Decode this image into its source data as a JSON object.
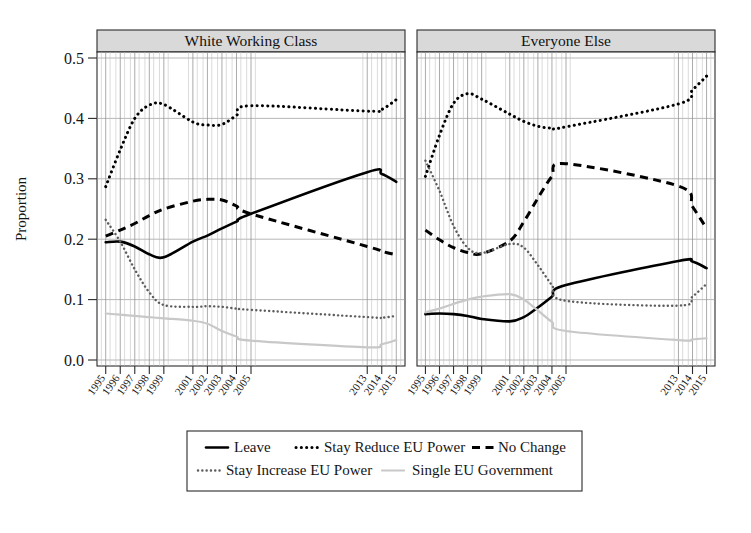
{
  "figure": {
    "ylabel": "Proportion",
    "panels": [
      {
        "title": "White Working Class"
      },
      {
        "title": "Everyone Else"
      }
    ]
  },
  "legend": {
    "items": [
      {
        "label": "Leave",
        "style": "solid",
        "color": "#000000"
      },
      {
        "label": "Stay Reduce EU Power",
        "style": "dotted-bold",
        "color": "#000000"
      },
      {
        "label": "No Change",
        "style": "dashed",
        "color": "#000000"
      },
      {
        "label": "Stay Increase EU Power",
        "style": "dotted-grey",
        "color": "#5d5d5d"
      },
      {
        "label": "Single EU Government",
        "style": "solid-light",
        "color": "#c8c8c8"
      }
    ]
  },
  "chart_data": {
    "type": "line",
    "title": "",
    "xlabel": "",
    "ylabel": "Proportion",
    "ylim": [
      0.0,
      0.5
    ],
    "yticks": [
      "0.0",
      "0.1",
      "0.2",
      "0.3",
      "0.4",
      "0.5"
    ],
    "ytickvalues": [
      0.0,
      0.1,
      0.2,
      0.3,
      0.4,
      0.5
    ],
    "grid": true,
    "legend_position": "bottom",
    "x": [
      1995,
      1996,
      1997,
      1998,
      1999,
      2001,
      2002,
      2003,
      2004,
      2005,
      2013,
      2014,
      2015
    ],
    "xticklabels": [
      "1995",
      "1996",
      "1997",
      "1998",
      "1999",
      "2001",
      "2002",
      "2003",
      "2004",
      "2005",
      "2013",
      "2014",
      "2015"
    ],
    "panels": [
      {
        "name": "White Working Class",
        "series": [
          {
            "name": "Leave",
            "style": "solid",
            "color": "#000000",
            "values": [
              0.195,
              0.196,
              0.188,
              0.175,
              0.17,
              0.196,
              0.206,
              0.218,
              0.229,
              0.242,
              0.311,
              0.308,
              0.295
            ]
          },
          {
            "name": "Stay Reduce EU Power",
            "style": "dotted-bold",
            "color": "#000000",
            "values": [
              0.287,
              0.348,
              0.4,
              0.422,
              0.423,
              0.394,
              0.389,
              0.39,
              0.405,
              0.421,
              0.412,
              0.415,
              0.431
            ]
          },
          {
            "name": "No Change",
            "style": "dashed",
            "color": "#000000",
            "values": [
              0.205,
              0.215,
              0.226,
              0.239,
              0.25,
              0.263,
              0.266,
              0.265,
              0.255,
              0.242,
              0.188,
              0.18,
              0.174
            ]
          },
          {
            "name": "Stay Increase EU Power",
            "style": "dotted-grey",
            "color": "#5d5d5d",
            "values": [
              0.232,
              0.196,
              0.15,
              0.112,
              0.091,
              0.088,
              0.089,
              0.088,
              0.085,
              0.083,
              0.071,
              0.07,
              0.073
            ]
          },
          {
            "name": "Single EU Government",
            "style": "solid-light",
            "color": "#c8c8c8",
            "values": [
              0.077,
              0.075,
              0.073,
              0.071,
              0.069,
              0.065,
              0.06,
              0.048,
              0.039,
              0.032,
              0.021,
              0.026,
              0.033
            ]
          }
        ]
      },
      {
        "name": "Everyone Else",
        "series": [
          {
            "name": "Leave",
            "style": "solid",
            "color": "#000000",
            "values": [
              0.076,
              0.077,
              0.076,
              0.073,
              0.068,
              0.064,
              0.071,
              0.087,
              0.105,
              0.124,
              0.164,
              0.163,
              0.152
            ]
          },
          {
            "name": "Stay Reduce EU Power",
            "style": "dotted-bold",
            "color": "#000000",
            "values": [
              0.304,
              0.372,
              0.425,
              0.441,
              0.432,
              0.407,
              0.395,
              0.387,
              0.384,
              0.386,
              0.424,
              0.447,
              0.47
            ]
          },
          {
            "name": "No Change",
            "style": "dashed",
            "color": "#000000",
            "values": [
              0.215,
              0.199,
              0.186,
              0.178,
              0.176,
              0.197,
              0.229,
              0.268,
              0.304,
              0.325,
              0.288,
              0.254,
              0.218
            ]
          },
          {
            "name": "Stay Increase EU Power",
            "style": "dotted-grey",
            "color": "#5d5d5d",
            "values": [
              0.33,
              0.28,
              0.222,
              0.186,
              0.177,
              0.192,
              0.186,
              0.157,
              0.124,
              0.098,
              0.09,
              0.105,
              0.126
            ]
          },
          {
            "name": "Single EU Government",
            "style": "solid-light",
            "color": "#c8c8c8",
            "values": [
              0.079,
              0.085,
              0.093,
              0.1,
              0.105,
              0.109,
              0.1,
              0.082,
              0.063,
              0.048,
              0.033,
              0.034,
              0.036
            ]
          }
        ]
      }
    ]
  }
}
